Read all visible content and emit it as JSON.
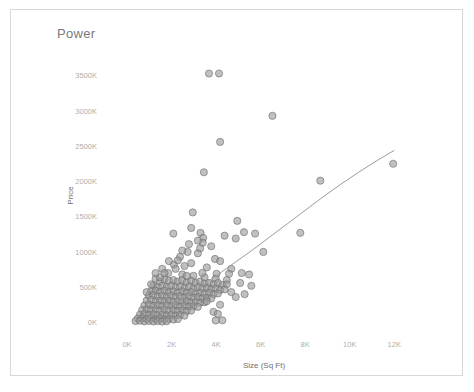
{
  "chart_title": "Power",
  "frame": {
    "border_color": "#d8d8d8"
  },
  "chart_data": {
    "type": "scatter",
    "title": "Power",
    "xlabel": "Size (Sq Ft)",
    "ylabel": "Price",
    "xlim": [
      -900,
      13200
    ],
    "ylim": [
      -150000,
      3750000
    ],
    "grid": false,
    "legend": "none",
    "marker_color": "#9a9a9a",
    "marker_edge_color": "#6a6a6a",
    "trend_line_color": "#9b9b9b",
    "xticks": [
      0,
      2000,
      4000,
      6000,
      8000,
      10000,
      12000
    ],
    "xticklabels": [
      "0K",
      "2K",
      "4K",
      "6K",
      "8K",
      "10K",
      "12K"
    ],
    "yticks": [
      0,
      500000,
      1000000,
      1500000,
      2000000,
      2500000,
      3000000,
      3500000
    ],
    "yticklabels": [
      "0K",
      "500K",
      "1000K",
      "1500K",
      "2000K",
      "2500K",
      "3000K",
      "3500K"
    ],
    "trend_line": [
      [
        900,
        60000
      ],
      [
        1600,
        180000
      ],
      [
        2400,
        330000
      ],
      [
        3200,
        490000
      ],
      [
        4000,
        660000
      ],
      [
        4800,
        840000
      ],
      [
        5600,
        1020000
      ],
      [
        6400,
        1210000
      ],
      [
        7200,
        1400000
      ],
      [
        8000,
        1590000
      ],
      [
        8800,
        1780000
      ],
      [
        9600,
        1960000
      ],
      [
        10400,
        2130000
      ],
      [
        11200,
        2290000
      ],
      [
        12000,
        2440000
      ]
    ],
    "points": [
      [
        3680,
        3530000
      ],
      [
        4130,
        3530000
      ],
      [
        6530,
        2930000
      ],
      [
        4180,
        2560000
      ],
      [
        11950,
        2250000
      ],
      [
        8680,
        2010000
      ],
      [
        3450,
        2130000
      ],
      [
        2950,
        1560000
      ],
      [
        4950,
        1440000
      ],
      [
        5250,
        1280000
      ],
      [
        5750,
        1260000
      ],
      [
        3300,
        1270000
      ],
      [
        3420,
        1200000
      ],
      [
        3400,
        1130000
      ],
      [
        3280,
        1050000
      ],
      [
        2780,
        1110000
      ],
      [
        2720,
        1000000
      ],
      [
        3180,
        980000
      ],
      [
        6120,
        1000000
      ],
      [
        7780,
        1270000
      ],
      [
        3950,
        900000
      ],
      [
        4180,
        870000
      ],
      [
        2380,
        930000
      ],
      [
        2100,
        820000
      ],
      [
        4680,
        760000
      ],
      [
        5150,
        700000
      ],
      [
        5480,
        680000
      ],
      [
        4020,
        690000
      ],
      [
        1580,
        760000
      ],
      [
        1850,
        700000
      ],
      [
        2480,
        680000
      ],
      [
        2980,
        660000
      ],
      [
        3480,
        640000
      ],
      [
        3980,
        620000
      ],
      [
        4480,
        600000
      ],
      [
        1280,
        620000
      ],
      [
        1480,
        580000
      ],
      [
        1680,
        610000
      ],
      [
        1880,
        590000
      ],
      [
        2080,
        600000
      ],
      [
        2280,
        580000
      ],
      [
        2480,
        600000
      ],
      [
        2680,
        570000
      ],
      [
        2880,
        590000
      ],
      [
        3080,
        560000
      ],
      [
        3280,
        580000
      ],
      [
        3480,
        550000
      ],
      [
        3680,
        560000
      ],
      [
        3880,
        540000
      ],
      [
        4080,
        560000
      ],
      [
        4280,
        530000
      ],
      [
        4480,
        540000
      ],
      [
        1180,
        520000
      ],
      [
        1380,
        500000
      ],
      [
        1580,
        520000
      ],
      [
        1780,
        500000
      ],
      [
        1980,
        520000
      ],
      [
        2180,
        500000
      ],
      [
        2380,
        510000
      ],
      [
        2580,
        490000
      ],
      [
        2780,
        510000
      ],
      [
        2980,
        480000
      ],
      [
        3180,
        500000
      ],
      [
        3380,
        480000
      ],
      [
        3580,
        490000
      ],
      [
        3780,
        470000
      ],
      [
        3980,
        480000
      ],
      [
        4180,
        460000
      ],
      [
        4380,
        470000
      ],
      [
        1080,
        440000
      ],
      [
        1280,
        450000
      ],
      [
        1480,
        430000
      ],
      [
        1680,
        450000
      ],
      [
        1880,
        430000
      ],
      [
        2080,
        440000
      ],
      [
        2280,
        420000
      ],
      [
        2480,
        440000
      ],
      [
        2680,
        420000
      ],
      [
        2880,
        430000
      ],
      [
        3080,
        410000
      ],
      [
        3280,
        420000
      ],
      [
        3480,
        410000
      ],
      [
        3680,
        420000
      ],
      [
        3880,
        400000
      ],
      [
        4080,
        410000
      ],
      [
        980,
        380000
      ],
      [
        1180,
        390000
      ],
      [
        1380,
        370000
      ],
      [
        1580,
        380000
      ],
      [
        1780,
        360000
      ],
      [
        1980,
        380000
      ],
      [
        2180,
        360000
      ],
      [
        2380,
        370000
      ],
      [
        2580,
        350000
      ],
      [
        2780,
        370000
      ],
      [
        2980,
        350000
      ],
      [
        3180,
        360000
      ],
      [
        3380,
        340000
      ],
      [
        3580,
        350000
      ],
      [
        3780,
        340000
      ],
      [
        880,
        310000
      ],
      [
        1080,
        320000
      ],
      [
        1280,
        300000
      ],
      [
        1480,
        310000
      ],
      [
        1680,
        300000
      ],
      [
        1880,
        310000
      ],
      [
        2080,
        290000
      ],
      [
        2280,
        300000
      ],
      [
        2480,
        290000
      ],
      [
        2680,
        300000
      ],
      [
        2880,
        280000
      ],
      [
        3080,
        290000
      ],
      [
        3280,
        280000
      ],
      [
        3480,
        285000
      ],
      [
        780,
        240000
      ],
      [
        980,
        250000
      ],
      [
        1180,
        235000
      ],
      [
        1380,
        245000
      ],
      [
        1580,
        230000
      ],
      [
        1780,
        245000
      ],
      [
        1980,
        230000
      ],
      [
        2180,
        240000
      ],
      [
        2380,
        225000
      ],
      [
        2580,
        235000
      ],
      [
        2780,
        225000
      ],
      [
        2980,
        230000
      ],
      [
        3180,
        220000
      ],
      [
        680,
        175000
      ],
      [
        880,
        185000
      ],
      [
        1080,
        170000
      ],
      [
        1280,
        180000
      ],
      [
        1480,
        165000
      ],
      [
        1680,
        180000
      ],
      [
        1880,
        168000
      ],
      [
        2080,
        175000
      ],
      [
        2280,
        162000
      ],
      [
        2480,
        172000
      ],
      [
        2680,
        160000
      ],
      [
        2880,
        168000
      ],
      [
        580,
        110000
      ],
      [
        780,
        120000
      ],
      [
        980,
        105000
      ],
      [
        1180,
        115000
      ],
      [
        1380,
        100000
      ],
      [
        1580,
        112000
      ],
      [
        1780,
        100000
      ],
      [
        1980,
        108000
      ],
      [
        2180,
        98000
      ],
      [
        2380,
        105000
      ],
      [
        2580,
        95000
      ],
      [
        480,
        55000
      ],
      [
        680,
        62000
      ],
      [
        880,
        48000
      ],
      [
        1080,
        58000
      ],
      [
        1280,
        45000
      ],
      [
        1480,
        55000
      ],
      [
        1680,
        44000
      ],
      [
        1880,
        52000
      ],
      [
        2080,
        40000
      ],
      [
        2280,
        48000
      ],
      [
        380,
        20000
      ],
      [
        580,
        25000
      ],
      [
        780,
        15000
      ],
      [
        980,
        22000
      ],
      [
        1180,
        14000
      ],
      [
        1380,
        20000
      ],
      [
        1580,
        12000
      ],
      [
        1780,
        18000
      ],
      [
        4280,
        30000
      ],
      [
        3980,
        28000
      ],
      [
        1480,
        640000
      ],
      [
        1680,
        700000
      ],
      [
        2180,
        760000
      ],
      [
        2580,
        800000
      ],
      [
        2880,
        840000
      ],
      [
        3580,
        780000
      ],
      [
        4580,
        690000
      ],
      [
        5080,
        560000
      ],
      [
        5580,
        520000
      ],
      [
        3780,
        1080000
      ],
      [
        3180,
        1160000
      ],
      [
        2480,
        1020000
      ],
      [
        4380,
        1230000
      ],
      [
        4880,
        1190000
      ],
      [
        1880,
        870000
      ],
      [
        2280,
        880000
      ],
      [
        4680,
        430000
      ],
      [
        5280,
        400000
      ],
      [
        4880,
        360000
      ],
      [
        3880,
        150000
      ],
      [
        4080,
        120000
      ],
      [
        2680,
        660000
      ],
      [
        3380,
        700000
      ],
      [
        3580,
        300000
      ],
      [
        4180,
        250000
      ],
      [
        1280,
        700000
      ],
      [
        1080,
        540000
      ],
      [
        880,
        430000
      ],
      [
        2080,
        1260000
      ],
      [
        2880,
        1340000
      ]
    ]
  }
}
